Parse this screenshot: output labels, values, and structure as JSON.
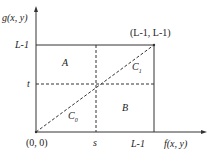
{
  "axes": {
    "y_label": "g(x, y)",
    "x_label": "f(x, y)"
  },
  "ticks": {
    "y_top": "L-1",
    "y_t": "t",
    "x_s": "s",
    "x_right": "L-1",
    "origin": "(0, 0)",
    "corner": "(L-1, L-1)"
  },
  "regions": {
    "a": "A",
    "b": "B",
    "c1": "C",
    "c1_sub": "1",
    "c0": "C",
    "c0_sub": "0"
  },
  "colors": {
    "line": "#333333"
  }
}
